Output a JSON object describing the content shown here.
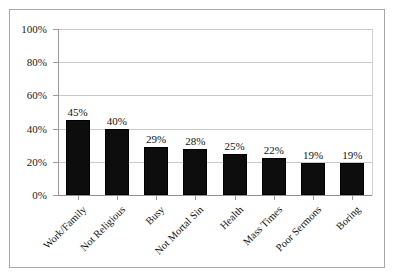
{
  "chart_data": {
    "type": "bar",
    "title": "",
    "subtitle": "",
    "xlabel": "",
    "ylabel": "",
    "ylim": [
      0,
      100
    ],
    "y_unit": "%",
    "grid": true,
    "legend": "none",
    "orientation": "vertical",
    "bar_color": "#0d0d0d",
    "gridline_color": "#c9c9c9",
    "border_color": "#a8a8a8",
    "background_color": "#ffffff",
    "y_ticks": [
      "0%",
      "20%",
      "40%",
      "60%",
      "80%",
      "100%"
    ],
    "y_tick_values": [
      0,
      20,
      40,
      60,
      80,
      100
    ],
    "categories": [
      "Work/Family",
      "Not Religious",
      "Busy",
      "Not Mortal Sin",
      "Health",
      "Mass Times",
      "Poor Sermons",
      "Boring"
    ],
    "values": [
      45,
      40,
      29,
      28,
      25,
      22,
      19,
      19
    ],
    "data_labels": [
      "45%",
      "40%",
      "29%",
      "28%",
      "25%",
      "22%",
      "19%",
      "19%"
    ]
  }
}
